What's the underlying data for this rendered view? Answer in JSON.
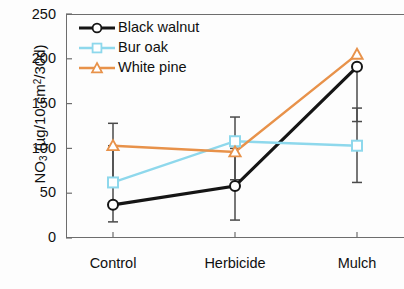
{
  "chart_data": {
    "type": "line",
    "title": "",
    "xlabel": "",
    "ylabel": "NO3 (µg/10 cm2/30d)",
    "ylabel_parts": {
      "prefix": "NO",
      "sub": "3",
      "mid": " (µg/10 cm",
      "sup": "2",
      "suffix": "/30d)"
    },
    "categories": [
      "Control",
      "Herbicide",
      "Mulch"
    ],
    "ylim": [
      0,
      250
    ],
    "yticks": [
      0,
      50,
      100,
      150,
      200,
      250
    ],
    "grid": false,
    "legend_position": "top-left-inside",
    "series": [
      {
        "name": "Black walnut",
        "color": "#151515",
        "marker": "circle",
        "values": [
          37,
          58,
          191
        ],
        "err_low": [
          18,
          20,
          130
        ],
        "err_high": [
          128,
          100,
          191
        ]
      },
      {
        "name": "Bur oak",
        "color": "#8ed8ec",
        "marker": "square",
        "values": [
          62,
          108,
          103
        ],
        "err_low": [
          62,
          65,
          62
        ],
        "err_high": [
          103,
          135,
          145
        ]
      },
      {
        "name": "White pine",
        "color": "#e8924a",
        "marker": "triangle",
        "values": [
          103,
          96,
          205
        ],
        "err_low": [
          103,
          96,
          205
        ],
        "err_high": [
          103,
          96,
          205
        ]
      }
    ]
  },
  "axis": {
    "ytick_labels": [
      "250",
      "200",
      "150",
      "100",
      "50",
      "0"
    ],
    "xtick_labels": [
      "Control",
      "Herbicide",
      "Mulch"
    ]
  },
  "legend": {
    "items": [
      {
        "label": "Black walnut",
        "color": "#151515",
        "marker": "circle"
      },
      {
        "label": "Bur oak",
        "color": "#8ed8ec",
        "marker": "square"
      },
      {
        "label": "White pine",
        "color": "#e8924a",
        "marker": "triangle"
      }
    ]
  }
}
